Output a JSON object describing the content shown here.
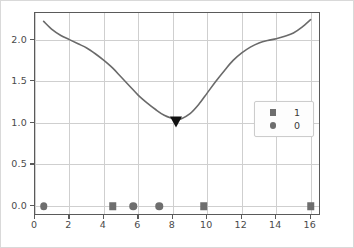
{
  "chart_data": {
    "type": "line",
    "title": "",
    "xlabel": "",
    "ylabel": "",
    "xlim": [
      0,
      16.6
    ],
    "ylim": [
      -0.12,
      2.32
    ],
    "grid": true,
    "legend_position": "center-right",
    "xticks": [
      "0",
      "2",
      "4",
      "6",
      "8",
      "10",
      "12",
      "14",
      "16"
    ],
    "xtick_values": [
      0,
      2,
      4,
      6,
      8,
      10,
      12,
      14,
      16
    ],
    "yticks": [
      "0.0",
      "0.5",
      "1.0",
      "1.5",
      "2.0"
    ],
    "ytick_values": [
      0.0,
      0.5,
      1.0,
      1.5,
      2.0
    ],
    "legend": [
      {
        "label": "1",
        "marker": "square",
        "color": "#6e6e6e"
      },
      {
        "label": "0",
        "marker": "circle",
        "color": "#6e6e6e"
      }
    ],
    "series": [
      {
        "name": "curve",
        "type": "line",
        "color": "#6a6a6a",
        "x": [
          0.5,
          1.0,
          1.5,
          2.0,
          2.5,
          3.0,
          3.5,
          4.0,
          4.5,
          5.0,
          5.5,
          6.0,
          6.5,
          7.0,
          7.5,
          8.0,
          8.2,
          8.5,
          9.0,
          9.5,
          10.0,
          10.5,
          11.0,
          11.5,
          12.0,
          12.5,
          13.0,
          13.5,
          14.0,
          14.5,
          15.0,
          15.5,
          16.0
        ],
        "y": [
          2.22,
          2.12,
          2.05,
          2.0,
          1.95,
          1.9,
          1.83,
          1.75,
          1.66,
          1.55,
          1.44,
          1.33,
          1.24,
          1.16,
          1.09,
          1.05,
          1.04,
          1.05,
          1.11,
          1.22,
          1.36,
          1.5,
          1.63,
          1.75,
          1.84,
          1.91,
          1.96,
          1.99,
          2.01,
          2.04,
          2.08,
          2.15,
          2.24
        ]
      },
      {
        "name": "0",
        "type": "scatter",
        "marker": "circle",
        "color": "#6e6e6e",
        "points": [
          {
            "x": 0.5,
            "y": 0.0
          },
          {
            "x": 5.7,
            "y": 0.0
          },
          {
            "x": 7.2,
            "y": 0.0
          }
        ]
      },
      {
        "name": "1",
        "type": "scatter",
        "marker": "square",
        "color": "#6e6e6e",
        "points": [
          {
            "x": 4.5,
            "y": 0.0
          },
          {
            "x": 9.8,
            "y": 0.0
          },
          {
            "x": 16.0,
            "y": 0.0
          }
        ]
      },
      {
        "name": "minimum-marker",
        "type": "scatter",
        "marker": "triangle-down",
        "color": "#111111",
        "points": [
          {
            "x": 8.2,
            "y": 1.05
          }
        ]
      }
    ]
  }
}
